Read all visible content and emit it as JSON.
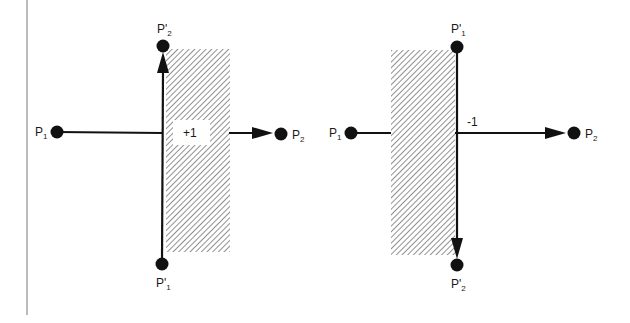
{
  "colors": {
    "ink": "#111111",
    "hatch": "#555555",
    "background": "#ffffff",
    "border": "#777777"
  },
  "left_figure": {
    "label_P1": "P",
    "label_P1_sub": "1",
    "label_P2": "P",
    "label_P2_sub": "2",
    "label_P1_prime": "P'",
    "label_P1_prime_sub": "1",
    "label_P2_prime": "P'",
    "label_P2_prime_sub": "2",
    "crossing_value": "+1"
  },
  "right_figure": {
    "label_P1": "P",
    "label_P1_sub": "1",
    "label_P2": "P",
    "label_P2_sub": "2",
    "label_P1_prime": "P'",
    "label_P1_prime_sub": "1",
    "label_P2_prime": "P'",
    "label_P2_prime_sub": "2",
    "crossing_value": "-1"
  }
}
